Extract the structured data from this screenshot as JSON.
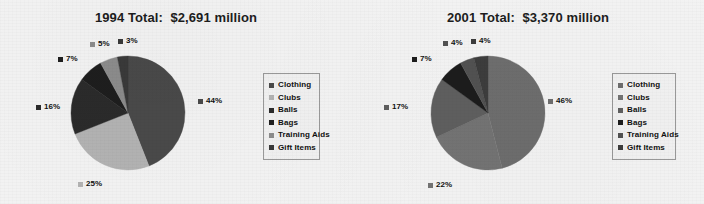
{
  "background_color": "#f4f4f4",
  "charts": [
    {
      "id": "chart-1994",
      "title": "1994 Total:  $2,691 million",
      "legend": {
        "items": [
          {
            "label": "Clothing",
            "color": "#4a4a4a"
          },
          {
            "label": "Clubs",
            "color": "#b4b4b4"
          },
          {
            "label": "Balls",
            "color": "#2b2b2b"
          },
          {
            "label": "Bags",
            "color": "#1e1e1e"
          },
          {
            "label": "Training Aids",
            "color": "#8d8d8d"
          },
          {
            "label": "Gift Items",
            "color": "#3a3a3a"
          }
        ]
      }
    },
    {
      "id": "chart-2001",
      "title": "2001 Total:  $3,370 million",
      "legend": {
        "items": [
          {
            "label": "Clothing",
            "color": "#6e6e6e"
          },
          {
            "label": "Clubs",
            "color": "#747474"
          },
          {
            "label": "Balls",
            "color": "#5f5f5f"
          },
          {
            "label": "Bags",
            "color": "#1c1c1c"
          },
          {
            "label": "Training Aids",
            "color": "#525252"
          },
          {
            "label": "Gift Items",
            "color": "#3d3d3d"
          }
        ]
      }
    }
  ],
  "chart_data": [
    {
      "type": "pie",
      "title": "1994 Total:  $2,691 million",
      "total_label": "$2,691 million",
      "year": "1994",
      "categories": [
        "Clothing",
        "Clubs",
        "Balls",
        "Bags",
        "Training Aids",
        "Gift Items"
      ],
      "values": [
        44,
        25,
        16,
        7,
        5,
        3
      ],
      "value_labels": [
        "44%",
        "25%",
        "16%",
        "7%",
        "5%",
        "3%"
      ],
      "colors": [
        "#4a4a4a",
        "#b4b4b4",
        "#2b2b2b",
        "#1e1e1e",
        "#8d8d8d",
        "#3a3a3a"
      ],
      "units": "percent",
      "legend_position": "right",
      "grid": false,
      "start_angle_deg": 0,
      "direction": "clockwise"
    },
    {
      "type": "pie",
      "title": "2001 Total:  $3,370 million",
      "total_label": "$3,370 million",
      "year": "2001",
      "categories": [
        "Clothing",
        "Clubs",
        "Balls",
        "Bags",
        "Training Aids",
        "Gift Items"
      ],
      "values": [
        46,
        22,
        17,
        7,
        4,
        4
      ],
      "value_labels": [
        "46%",
        "22%",
        "17%",
        "7%",
        "4%",
        "4%"
      ],
      "colors": [
        "#6e6e6e",
        "#747474",
        "#5f5f5f",
        "#1c1c1c",
        "#525252",
        "#3d3d3d"
      ],
      "units": "percent",
      "legend_position": "right",
      "grid": false,
      "start_angle_deg": 0,
      "direction": "clockwise"
    }
  ],
  "labels_1994": [
    {
      "text": "44%",
      "color": "#4a4a4a"
    },
    {
      "text": "25%",
      "color": "#b4b4b4"
    },
    {
      "text": "16%",
      "color": "#2b2b2b"
    },
    {
      "text": "7%",
      "color": "#1e1e1e"
    },
    {
      "text": "5%",
      "color": "#8d8d8d"
    },
    {
      "text": "3%",
      "color": "#3a3a3a"
    }
  ],
  "labels_2001": [
    {
      "text": "46%",
      "color": "#6e6e6e"
    },
    {
      "text": "22%",
      "color": "#747474"
    },
    {
      "text": "17%",
      "color": "#5f5f5f"
    },
    {
      "text": "7%",
      "color": "#1c1c1c"
    },
    {
      "text": "4%",
      "color": "#525252"
    },
    {
      "text": "4%",
      "color": "#3d3d3d"
    }
  ]
}
